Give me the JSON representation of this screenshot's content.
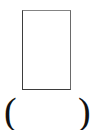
{
  "figure": {
    "background_color": "#ffffff",
    "box": {
      "label": "",
      "fill_color": "#ffffff",
      "border_color": "#5a5a5a",
      "border_width_px": 1.5,
      "x": 22,
      "y": 10,
      "width": 49,
      "height": 80
    },
    "parentheses": {
      "open": "(",
      "close": ")",
      "color": "#111111",
      "content": "",
      "font_size_px": 38,
      "open_x": 6,
      "close_x": 81,
      "y": 100
    }
  }
}
